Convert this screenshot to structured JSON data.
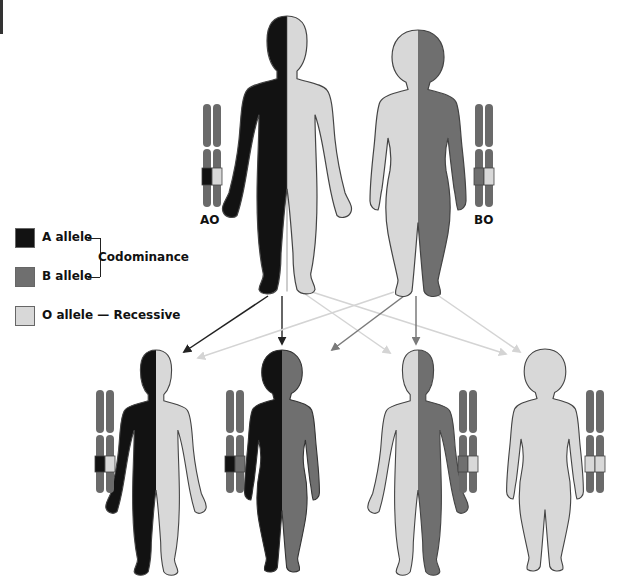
{
  "colors": {
    "a_allele": "#121212",
    "b_allele": "#6f6f6f",
    "o_allele": "#d8d8d8",
    "outline": "#444444",
    "chromosome": "#6a6a6a",
    "arrow_a": "#222222",
    "arrow_b": "#7a7a7a",
    "arrow_o": "#d4d4d4"
  },
  "legend": {
    "a": {
      "label": "A allele"
    },
    "b": {
      "label": "B allele"
    },
    "codominance": "Codominance",
    "o": {
      "label": "O allele",
      "dash": "—",
      "note": "Recessive"
    }
  },
  "parents": [
    {
      "id": "father",
      "genotype": "AO",
      "left": "A",
      "right": "O",
      "sex": "male"
    },
    {
      "id": "mother",
      "genotype": "BO",
      "left": "O",
      "right": "B",
      "sex": "female"
    }
  ],
  "children": [
    {
      "id": "child-1",
      "genotype": "AO",
      "left": "A",
      "right": "O",
      "sex": "male"
    },
    {
      "id": "child-2",
      "genotype": "AB",
      "left": "A",
      "right": "B",
      "sex": "female"
    },
    {
      "id": "child-3",
      "genotype": "BO",
      "left": "O",
      "right": "B",
      "sex": "male"
    },
    {
      "id": "child-4",
      "genotype": "OO",
      "left": "O",
      "right": "O",
      "sex": "female"
    }
  ],
  "arrows": [
    {
      "from": "father",
      "to": "child-1",
      "allele": "A"
    },
    {
      "from": "father",
      "to": "child-2",
      "allele": "A"
    },
    {
      "from": "father",
      "to": "child-3",
      "allele": "O"
    },
    {
      "from": "father",
      "to": "child-4",
      "allele": "O"
    },
    {
      "from": "mother",
      "to": "child-1",
      "allele": "O"
    },
    {
      "from": "mother",
      "to": "child-2",
      "allele": "B"
    },
    {
      "from": "mother",
      "to": "child-3",
      "allele": "B"
    },
    {
      "from": "mother",
      "to": "child-4",
      "allele": "O"
    }
  ]
}
